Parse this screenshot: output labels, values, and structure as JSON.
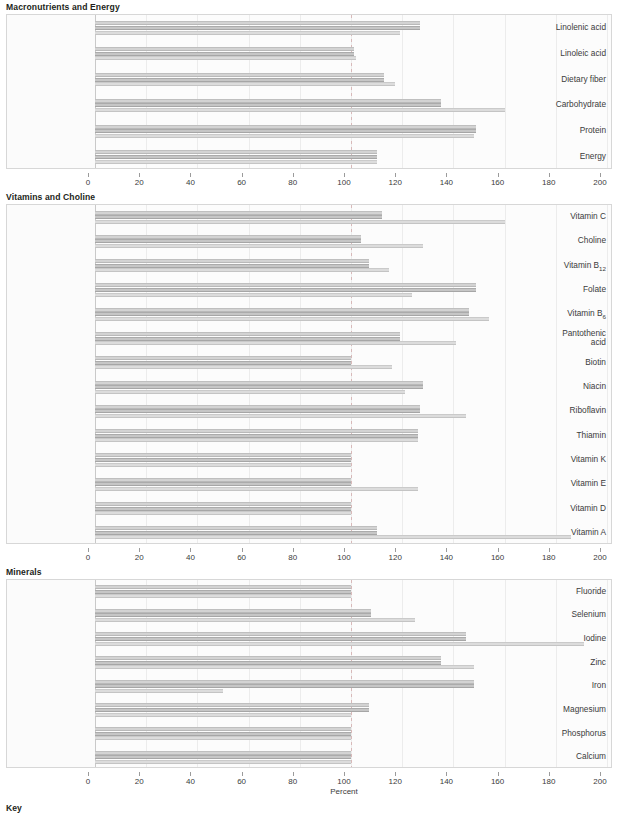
{
  "axis": {
    "label": "Percent",
    "ticks": [
      0,
      20,
      40,
      60,
      80,
      100,
      120,
      140,
      160,
      180,
      200
    ],
    "min": 0,
    "max": 200,
    "reference_value": 100
  },
  "key": {
    "title": "Key"
  },
  "colors": {
    "series1": "#d3d3d3",
    "series2": "#c6c6c6",
    "series3": "#dcdcdc",
    "reference_line": "#d8b9b9",
    "panel_background": "#fbfbfb",
    "panel_border": "#d7d7d7",
    "text": "#231f20"
  },
  "sections": [
    {
      "title": "Macronutrients and Energy"
    },
    {
      "title": "Vitamins and Choline"
    },
    {
      "title": "Minerals"
    }
  ],
  "chart_data": [
    {
      "type": "bar",
      "orientation": "horizontal",
      "title": "Macronutrients and Energy",
      "xlabel": "Percent",
      "ylabel": "",
      "xlim": [
        0,
        200
      ],
      "grid": true,
      "reference_line": 100,
      "legend": "Key",
      "categories": [
        "Energy",
        "Protein",
        "Carbohydrate",
        "Dietary fiber",
        "Linoleic acid",
        "Linolenic acid"
      ],
      "series": [
        {
          "name": "series1",
          "values": [
            110,
            149,
            135,
            113,
            101,
            127
          ]
        },
        {
          "name": "series2",
          "values": [
            110,
            149,
            135,
            113,
            101,
            127
          ]
        },
        {
          "name": "series3",
          "values": [
            110,
            148,
            160,
            117,
            102,
            119
          ]
        }
      ]
    },
    {
      "type": "bar",
      "orientation": "horizontal",
      "title": "Vitamins and Choline",
      "xlabel": "Percent",
      "ylabel": "",
      "xlim": [
        0,
        200
      ],
      "grid": true,
      "reference_line": 100,
      "legend": "Key",
      "categories": [
        "Vitamin A",
        "Vitamin D",
        "Vitamin E",
        "Vitamin K",
        "Thiamin",
        "Riboflavin",
        "Niacin",
        "Biotin",
        "Pantothenic acid",
        "Vitamin B₆",
        "Folate",
        "Vitamin B₁₂",
        "Choline",
        "Vitamin C"
      ],
      "series": [
        {
          "name": "series1",
          "values": [
            110,
            100,
            100,
            100,
            126,
            127,
            128,
            100,
            119,
            146,
            149,
            107,
            104,
            112
          ]
        },
        {
          "name": "series2",
          "values": [
            110,
            100,
            100,
            100,
            126,
            127,
            128,
            100,
            119,
            146,
            149,
            107,
            104,
            112
          ]
        },
        {
          "name": "series3",
          "values": [
            186,
            100,
            126,
            100,
            126,
            145,
            121,
            116,
            141,
            154,
            124,
            115,
            128,
            160
          ]
        }
      ]
    },
    {
      "type": "bar",
      "orientation": "horizontal",
      "title": "Minerals",
      "xlabel": "Percent",
      "ylabel": "",
      "xlim": [
        0,
        200
      ],
      "grid": true,
      "reference_line": 100,
      "legend": "Key",
      "categories": [
        "Calcium",
        "Phosphorus",
        "Magnesium",
        "Iron",
        "Zinc",
        "Iodine",
        "Selenium",
        "Fluoride"
      ],
      "series": [
        {
          "name": "series1",
          "values": [
            100,
            100,
            107,
            148,
            135,
            145,
            108,
            100
          ]
        },
        {
          "name": "series2",
          "values": [
            100,
            100,
            107,
            148,
            135,
            145,
            108,
            100
          ]
        },
        {
          "name": "series3",
          "values": [
            100,
            100,
            100,
            50,
            148,
            191,
            125,
            100
          ]
        }
      ]
    }
  ],
  "geometry": {
    "panels": [
      {
        "top": 14,
        "height": 155,
        "axis_top": 169
      },
      {
        "top": 204,
        "height": 340,
        "axis_top": 544
      },
      {
        "top": 579,
        "height": 189,
        "axis_top": 768
      }
    ],
    "plot_left": 88,
    "plot_right": 600,
    "axis_caption_y": 788,
    "key_y": 804
  }
}
